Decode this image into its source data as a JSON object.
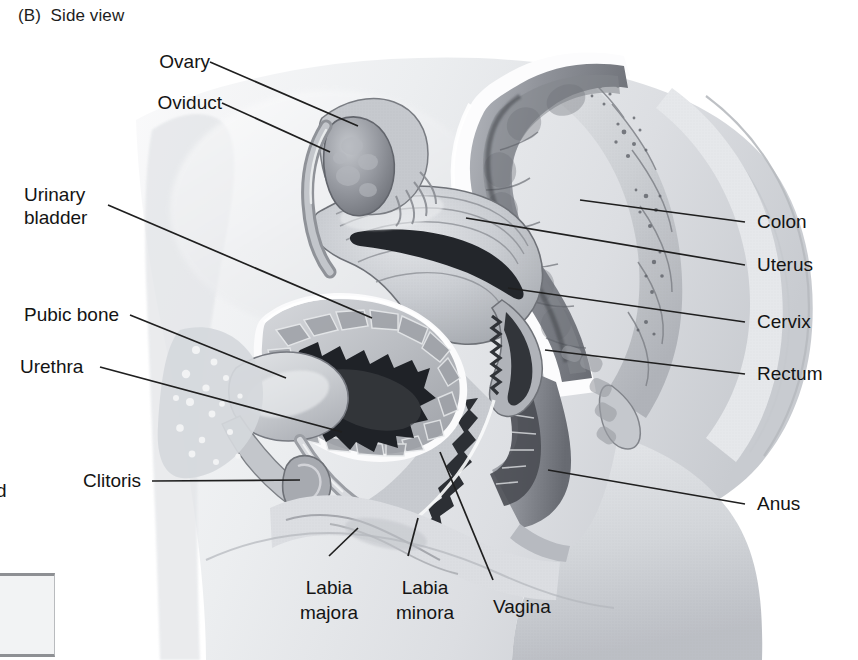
{
  "figure": {
    "panel_label": "(B)  Side view",
    "view": "sagittal side view of female pelvis",
    "style": "grayscale halftone textbook illustration"
  },
  "labels": {
    "ovary": "Ovary",
    "oviduct": "Oviduct",
    "urinary_bladder_line1": "Urinary",
    "urinary_bladder_line2": "bladder",
    "pubic_bone": "Pubic bone",
    "urethra": "Urethra",
    "clitoris": "Clitoris",
    "colon": "Colon",
    "uterus": "Uterus",
    "cervix": "Cervix",
    "rectum": "Rectum",
    "anus": "Anus",
    "labia_majora_line1": "Labia",
    "labia_majora_line2": "majora",
    "labia_minora_line1": "Labia",
    "labia_minora_line2": "minora",
    "vagina": "Vagina"
  },
  "edge_fragment": "d",
  "colors": {
    "background": "#ffffff",
    "leader_line": "#1f1f1f",
    "text": "#141414",
    "skin_light": "#e9eaec",
    "skin_mid": "#d2d4d8",
    "skin_shadow": "#b9bcc1",
    "organ_light": "#d8dadd",
    "organ_mid": "#a9acb2",
    "organ_dark": "#7c7f85",
    "lumen_dark": "#2b2d30",
    "highlight": "#fdfdfd",
    "bone": "#c9ccd1",
    "corner_box_fill": "#f2f3f4",
    "corner_box_border": "#8e9094"
  },
  "anatomy_parts": [
    "ovary",
    "oviduct",
    "uterus",
    "cervix",
    "vagina",
    "urinary bladder",
    "urethra",
    "pubic bone",
    "clitoris",
    "labia majora",
    "labia minora",
    "colon",
    "rectum",
    "anus",
    "sacrum",
    "coccyx"
  ]
}
